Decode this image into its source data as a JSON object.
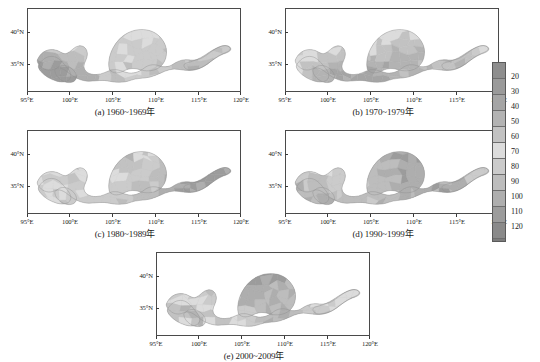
{
  "figure": {
    "kind": "multi-panel-choropleth-map-series",
    "region_name": "Yellow River Basin",
    "units_implied": "days"
  },
  "chart_data": {
    "type": "heatmap",
    "title": "",
    "xlabel": "",
    "ylabel": "",
    "xlim": [
      95,
      120
    ],
    "ylim": [
      31.5,
      42.5
    ],
    "grid": false,
    "legend_position": "right",
    "x_tick_labels": [
      "95°E",
      "100°E",
      "105°E",
      "110°E",
      "115°E",
      "120°E"
    ],
    "x_tick_values": [
      95,
      100,
      105,
      110,
      115,
      120
    ],
    "y_tick_labels": [
      "40°N",
      "35°N"
    ],
    "y_tick_values": [
      40,
      35
    ],
    "colorbar": {
      "orientation": "vertical",
      "vmin": 10,
      "vmax": 130,
      "tick_labels": [
        "20",
        "30",
        "40",
        "50",
        "60",
        "70",
        "80",
        "90",
        "100",
        "110",
        "120"
      ],
      "tick_values": [
        20,
        30,
        40,
        50,
        60,
        70,
        80,
        90,
        100,
        110,
        120
      ],
      "band_values": [
        15,
        25,
        35,
        45,
        55,
        65,
        75,
        85,
        95,
        105,
        115,
        125
      ],
      "band_colors": [
        "#8e8e8e",
        "#9a9a9a",
        "#a5a5a5",
        "#b3b3b3",
        "#c2c2c2",
        "#dcdcdc",
        "#cbcbcb",
        "#bdbdbd",
        "#aeaeae",
        "#9c9c9c",
        "#8a8a8a",
        "#7c7c7c"
      ]
    },
    "panels": [
      {
        "id": "a",
        "caption": "(a) 1960~1969年",
        "decade_start": 1960,
        "decade_end": 1969,
        "mean_level": 78,
        "level_range": [
          45,
          110
        ],
        "description": "Basin-wide moderate-to-dark shading; darker core over the central loess region."
      },
      {
        "id": "b",
        "caption": "(b) 1970~1979年",
        "decade_start": 1970,
        "decade_end": 1979,
        "mean_level": 66,
        "level_range": [
          40,
          100
        ],
        "description": "Lightest decade overall; broad pale areas across the northern and central basin."
      },
      {
        "id": "c",
        "caption": "(c) 1980~1989年",
        "decade_start": 1980,
        "decade_end": 1989,
        "mean_level": 71,
        "level_range": [
          40,
          105
        ],
        "description": "Light to moderate shading with scattered darker patches near 105°E."
      },
      {
        "id": "d",
        "caption": "(d) 1990~1999年",
        "decade_start": 1990,
        "decade_end": 1999,
        "mean_level": 83,
        "level_range": [
          50,
          115
        ],
        "description": "Markedly darker than the 1970s and 1980s, especially in the south-west headwaters."
      },
      {
        "id": "e",
        "caption": "(e) 2000~2009年",
        "decade_start": 2000,
        "decade_end": 2009,
        "mean_level": 86,
        "level_range": [
          50,
          120
        ],
        "description": "Darkest decade; extensive dark shading through the central and eastern basin."
      }
    ]
  }
}
